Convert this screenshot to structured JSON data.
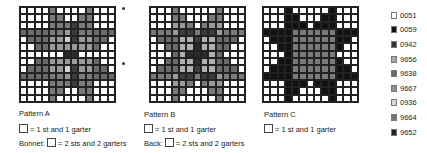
{
  "legend": [
    {
      "code": "0051",
      "color": "#ffffff"
    },
    {
      "code": "0059",
      "color": "#111111"
    },
    {
      "code": "0942",
      "color": "#333333"
    },
    {
      "code": "9656",
      "color": "#a9a9a9"
    },
    {
      "code": "9638",
      "color": "#6a6a6a"
    },
    {
      "code": "9667",
      "color": "#8f8f8f"
    },
    {
      "code": "0936",
      "color": "#d9d9d9"
    },
    {
      "code": "9664",
      "color": "#777777"
    },
    {
      "code": "9652",
      "color": "#222222"
    }
  ],
  "patterns": [
    {
      "id": "A",
      "title": "Pattern A",
      "key": "= 1 st and 1 garter",
      "extra_label": "Bonnet:",
      "extra_key": "= 2 sts and 2 garters",
      "grid": [
        "0000700007000",
        "0000770077000",
        "0000777877000",
        "3333776877333",
        "0333665866330",
        "0033666666300",
        "0000002200000",
        "0033666666300",
        "0333665866330",
        "3333776877333",
        "0000777877000",
        "0000770077000",
        "0000700007000"
      ]
    },
    {
      "id": "B",
      "title": "Pattern B",
      "key": "= 1 st and 1 garter",
      "extra_label": "Back:",
      "extra_key": "= 2 sts and 2 garters",
      "grid": [
        "0007000007000",
        "0007700077000",
        "0006670766000",
        "7776887886777",
        "0333448443330",
        "0033442443300",
        "0003422243000",
        "0033442443300",
        "0333448443330",
        "7776887886777",
        "0006670766000",
        "0007700077000",
        "0007000007000"
      ]
    },
    {
      "id": "C",
      "title": "Pattern C",
      "key": "= 1 st and 1 garter",
      "grid": [
        "0001000001000",
        "0001100011000",
        "0001110111000",
        "1111777777111",
        "0111777777110",
        "0011777777100",
        "0001777777000",
        "0011777777100",
        "0111777777110",
        "1111777777111",
        "0001110111000",
        "0001100011000",
        "0001000001000"
      ]
    }
  ]
}
